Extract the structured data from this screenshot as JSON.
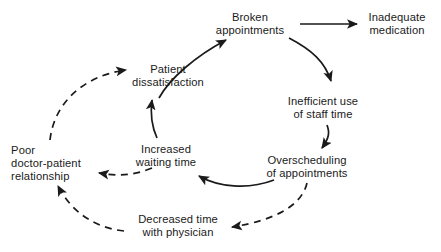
{
  "diagram": {
    "background_color": "#ffffff",
    "stroke_color": "#1a1a1a",
    "text_color": "#1a1a1a",
    "nodes": [
      {
        "id": "broken-appointments",
        "label": "Broken\nappointments",
        "x": 250,
        "y": 24,
        "align": "center"
      },
      {
        "id": "inadequate-medication",
        "label": "Inadequate\nmedication",
        "x": 397,
        "y": 24,
        "align": "center"
      },
      {
        "id": "inefficient-use",
        "label": "Inefficient use\nof staff time",
        "x": 323,
        "y": 108,
        "align": "center"
      },
      {
        "id": "overscheduling",
        "label": "Overscheduling\nof appointments",
        "x": 307,
        "y": 167,
        "align": "center"
      },
      {
        "id": "decreased-time",
        "label": "Decreased time\nwith physician",
        "x": 178,
        "y": 226,
        "align": "center"
      },
      {
        "id": "poor-relationship",
        "label": "Poor\ndoctor-patient\nrelationship",
        "x": 46,
        "y": 164,
        "align": "left"
      },
      {
        "id": "increased-waiting",
        "label": "Increased\nwaiting time",
        "x": 166,
        "y": 156,
        "align": "center"
      },
      {
        "id": "patient-dissatisfaction",
        "label": "Patient\ndissatisfaction",
        "x": 168,
        "y": 76,
        "align": "center"
      }
    ],
    "edges": [
      {
        "id": "edge-dissatisfaction-to-broken",
        "from": "patient-dissatisfaction",
        "to": "broken-appointments",
        "style": "solid"
      },
      {
        "id": "edge-broken-to-medication",
        "from": "broken-appointments",
        "to": "inadequate-medication",
        "style": "solid"
      },
      {
        "id": "edge-broken-to-inefficient",
        "from": "broken-appointments",
        "to": "inefficient-use",
        "style": "solid"
      },
      {
        "id": "edge-inefficient-to-overscheduling",
        "from": "inefficient-use",
        "to": "overscheduling",
        "style": "solid"
      },
      {
        "id": "edge-overscheduling-to-waiting",
        "from": "overscheduling",
        "to": "increased-waiting",
        "style": "solid"
      },
      {
        "id": "edge-waiting-to-dissatisfaction",
        "from": "increased-waiting",
        "to": "patient-dissatisfaction",
        "style": "solid"
      },
      {
        "id": "edge-overscheduling-to-decreased",
        "from": "overscheduling",
        "to": "decreased-time",
        "style": "dashed"
      },
      {
        "id": "edge-decreased-to-poor",
        "from": "decreased-time",
        "to": "poor-relationship",
        "style": "dashed"
      },
      {
        "id": "edge-waiting-to-poor",
        "from": "increased-waiting",
        "to": "poor-relationship",
        "style": "dashed"
      },
      {
        "id": "edge-poor-to-dissatisfaction",
        "from": "poor-relationship",
        "to": "patient-dissatisfaction",
        "style": "dashed"
      }
    ]
  }
}
